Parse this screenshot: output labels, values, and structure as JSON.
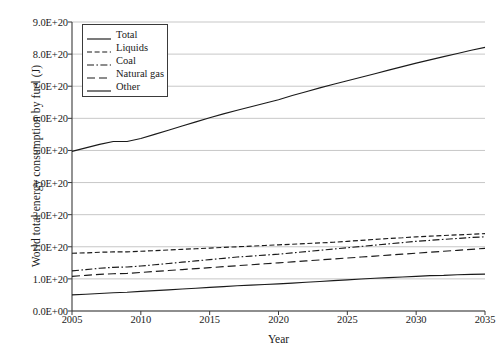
{
  "chart_data": {
    "type": "line",
    "title": "",
    "xlabel": "Year",
    "ylabel": "World total energy consumption by fuel (J)",
    "xlim": [
      2005,
      2035
    ],
    "ylim": [
      0,
      9e+20
    ],
    "grid": "horizontal",
    "legend_position": "upper-left-inside",
    "xticks": [
      2005,
      2010,
      2015,
      2020,
      2025,
      2030,
      2035
    ],
    "xtick_labels": [
      "2005",
      "2010",
      "2015",
      "2020",
      "2025",
      "2030",
      "2035"
    ],
    "yticks": [
      0,
      1e+20,
      2e+20,
      3e+20,
      4e+20,
      5e+20,
      6e+20,
      7e+20,
      8e+20,
      9e+20
    ],
    "ytick_labels": [
      "0.0E+00",
      "1.0E+20",
      "2.0E+20",
      "3.0E+20",
      "4.0E+20",
      "5.0E+20",
      "6.0E+20",
      "7.0E+20",
      "8.0E+20",
      "9.0E+20"
    ],
    "x": [
      2005,
      2006,
      2007,
      2008,
      2009,
      2010,
      2011,
      2012,
      2013,
      2014,
      2015,
      2016,
      2017,
      2018,
      2019,
      2020,
      2021,
      2022,
      2023,
      2024,
      2025,
      2026,
      2027,
      2028,
      2029,
      2030,
      2031,
      2032,
      2033,
      2034,
      2035
    ],
    "series": [
      {
        "name": "Total",
        "style": "solid",
        "color": "#1a1a1a",
        "values": [
          4.97e+20,
          5.08e+20,
          5.19e+20,
          5.28e+20,
          5.28e+20,
          5.37e+20,
          5.5e+20,
          5.63e+20,
          5.76e+20,
          5.89e+20,
          6.02e+20,
          6.14e+20,
          6.25e+20,
          6.36e+20,
          6.47e+20,
          6.58e+20,
          6.71e+20,
          6.83e+20,
          6.95e+20,
          7.06e+20,
          7.17e+20,
          7.28e+20,
          7.39e+20,
          7.5e+20,
          7.61e+20,
          7.72e+20,
          7.82e+20,
          7.92e+20,
          8.02e+20,
          8.12e+20,
          8.21e+20
        ]
      },
      {
        "name": "Liquids",
        "style": "dashed",
        "color": "#1a1a1a",
        "values": [
          1.8e+20,
          1.81e+20,
          1.83e+20,
          1.84e+20,
          1.84e+20,
          1.86e+20,
          1.88e+20,
          1.9e+20,
          1.92e+20,
          1.94e+20,
          1.96e+20,
          1.98e+20,
          2e+20,
          2.02e+20,
          2.04e+20,
          2.06e+20,
          2.08e+20,
          2.1e+20,
          2.12e+20,
          2.14e+20,
          2.17e+20,
          2.2e+20,
          2.23e+20,
          2.26e+20,
          2.28e+20,
          2.31e+20,
          2.33e+20,
          2.35e+20,
          2.37e+20,
          2.39e+20,
          2.41e+20
        ]
      },
      {
        "name": "Coal",
        "style": "dashdot",
        "color": "#1a1a1a",
        "values": [
          1.25e+20,
          1.29e+20,
          1.33e+20,
          1.36e+20,
          1.37e+20,
          1.4e+20,
          1.44e+20,
          1.48e+20,
          1.52e+20,
          1.56e+20,
          1.6e+20,
          1.64e+20,
          1.68e+20,
          1.71e+20,
          1.74e+20,
          1.77e+20,
          1.81e+20,
          1.85e+20,
          1.89e+20,
          1.93e+20,
          1.97e+20,
          2.01e+20,
          2.05e+20,
          2.09e+20,
          2.13e+20,
          2.17e+20,
          2.2e+20,
          2.23e+20,
          2.26e+20,
          2.29e+20,
          2.31e+20
        ]
      },
      {
        "name": "Natural gas",
        "style": "longdash",
        "color": "#1a1a1a",
        "values": [
          1.08e+20,
          1.11e+20,
          1.14e+20,
          1.16e+20,
          1.17e+20,
          1.2e+20,
          1.23e+20,
          1.26e+20,
          1.29e+20,
          1.32e+20,
          1.35e+20,
          1.38e+20,
          1.41e+20,
          1.44e+20,
          1.47e+20,
          1.5e+20,
          1.53e+20,
          1.56e+20,
          1.59e+20,
          1.62e+20,
          1.65e+20,
          1.68e+20,
          1.71e+20,
          1.74e+20,
          1.77e+20,
          1.8e+20,
          1.83e+20,
          1.86e+20,
          1.89e+20,
          1.92e+20,
          1.95e+20
        ]
      },
      {
        "name": "Other",
        "style": "solid",
        "color": "#1a1a1a",
        "values": [
          5e+19,
          5.2e+19,
          5.45e+19,
          5.7e+19,
          5.85e+19,
          6.1e+19,
          6.35e+19,
          6.6e+19,
          6.85e+19,
          7.1e+19,
          7.35e+19,
          7.6e+19,
          7.85e+19,
          8.05e+19,
          8.25e+19,
          8.45e+19,
          8.7e+19,
          8.95e+19,
          9.2e+19,
          9.45e+19,
          9.7e+19,
          9.95e+19,
          1.02e+20,
          1.04e+20,
          1.06e+20,
          1.08e+20,
          1.1e+20,
          1.11e+20,
          1.13e+20,
          1.14e+20,
          1.15e+20
        ]
      }
    ]
  },
  "legend": {
    "entries": [
      {
        "label": "Total"
      },
      {
        "label": "Liquids"
      },
      {
        "label": "Coal"
      },
      {
        "label": "Natural gas"
      },
      {
        "label": "Other"
      }
    ]
  }
}
